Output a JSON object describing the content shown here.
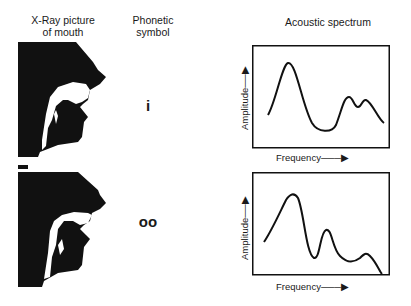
{
  "headers": {
    "xray": [
      "X-Ray picture",
      "of mouth"
    ],
    "phonetic": [
      "Phonetic",
      "symbol"
    ],
    "spectrum": "Acoustic spectrum"
  },
  "rows": [
    {
      "symbol": "i",
      "spectrum": {
        "ylabel": "Amplitude",
        "xlabel": "Frequency"
      }
    },
    {
      "symbol": "oo",
      "spectrum": {
        "ylabel": "Amplitude",
        "xlabel": "Frequency"
      }
    }
  ],
  "colors": {
    "ink": "#111111",
    "background": "#ffffff"
  }
}
